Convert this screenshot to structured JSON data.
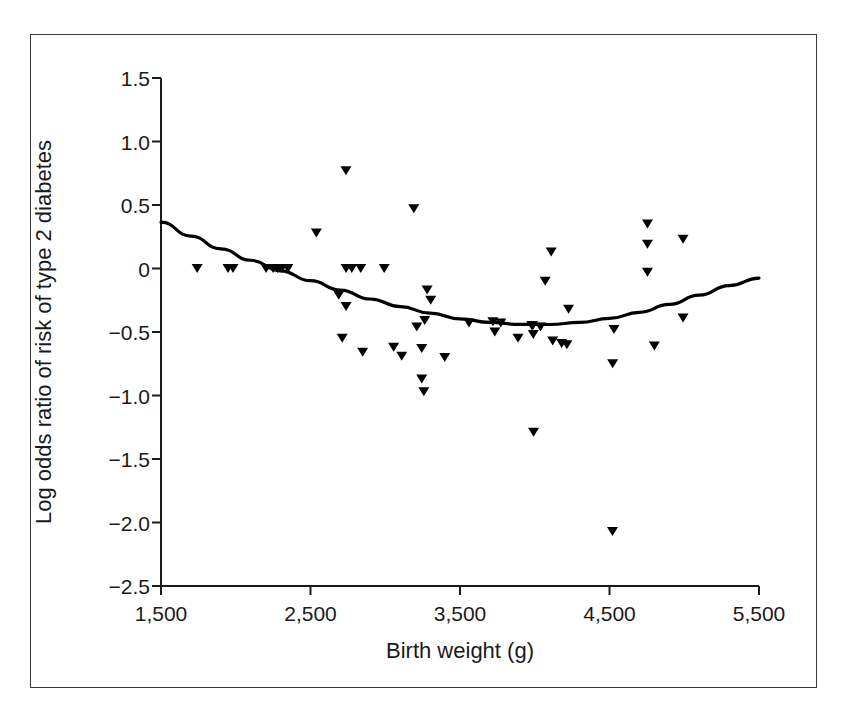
{
  "chart_data": {
    "type": "scatter",
    "title": "",
    "xlabel": "Birth weight (g)",
    "ylabel": "Log odds ratio of risk of type 2 diabetes",
    "xlim": [
      1500,
      5500
    ],
    "ylim": [
      -2.5,
      1.5
    ],
    "xticks": [
      1500,
      2500,
      3500,
      4500,
      5500
    ],
    "xtick_labels": [
      "1,500",
      "2,500",
      "3,500",
      "4,500",
      "5,500"
    ],
    "yticks": [
      1.5,
      1.0,
      0.5,
      0,
      -0.5,
      -1.0,
      -1.5,
      -2.0,
      -2.5
    ],
    "ytick_labels": [
      "1.5",
      "1.0",
      "0.5",
      "0",
      "−0.5",
      "−1.0",
      "−1.5",
      "−2.0",
      "−2.5"
    ],
    "grid": false,
    "legend": false,
    "marker": "triangle-down",
    "marker_color": "#000000",
    "series": [
      {
        "name": "Studies",
        "type": "scatter",
        "points": [
          [
            1742,
            0.0
          ],
          [
            1948,
            0.0
          ],
          [
            1982,
            0.0
          ],
          [
            2203,
            0.0
          ],
          [
            2250,
            0.0
          ],
          [
            2281,
            0.0
          ],
          [
            2308,
            0.0
          ],
          [
            2349,
            0.0
          ],
          [
            2539,
            0.28
          ],
          [
            2738,
            0.0
          ],
          [
            2776,
            0.0
          ],
          [
            2738,
            -0.3
          ],
          [
            2737,
            0.77
          ],
          [
            2712,
            -0.55
          ],
          [
            2689,
            -0.21
          ],
          [
            2849,
            -0.66
          ],
          [
            2993,
            0.0
          ],
          [
            3191,
            0.47
          ],
          [
            3056,
            -0.62
          ],
          [
            3244,
            -0.63
          ],
          [
            3211,
            -0.46
          ],
          [
            3280,
            -0.17
          ],
          [
            3304,
            -0.25
          ],
          [
            3244,
            -0.87
          ],
          [
            3110,
            -0.69
          ],
          [
            3258,
            -0.97
          ],
          [
            3398,
            -0.7
          ],
          [
            3264,
            -0.41
          ],
          [
            3560,
            -0.43
          ],
          [
            3720,
            -0.42
          ],
          [
            3773,
            -0.43
          ],
          [
            3733,
            -0.5
          ],
          [
            3888,
            -0.55
          ],
          [
            3987,
            -0.45
          ],
          [
            3990,
            -0.52
          ],
          [
            4038,
            -0.46
          ],
          [
            4110,
            0.13
          ],
          [
            4120,
            -0.57
          ],
          [
            4180,
            -0.59
          ],
          [
            4215,
            -0.6
          ],
          [
            4226,
            -0.32
          ],
          [
            4070,
            -0.1
          ],
          [
            3992,
            -1.29
          ],
          [
            4520,
            -2.07
          ],
          [
            4521,
            -0.75
          ],
          [
            4754,
            0.35
          ],
          [
            4754,
            0.19
          ],
          [
            4754,
            -0.03
          ],
          [
            4992,
            0.23
          ],
          [
            4992,
            -0.39
          ],
          [
            4800,
            -0.61
          ],
          [
            4530,
            -0.48
          ],
          [
            2836,
            0.0
          ],
          [
            3980,
            -0.45
          ]
        ]
      },
      {
        "name": "Fitted quadratic curve",
        "type": "line",
        "line_color": "#000000",
        "line_width": 3.2,
        "points": [
          [
            1500,
            0.365
          ],
          [
            1700,
            0.255
          ],
          [
            1900,
            0.155
          ],
          [
            2100,
            0.065
          ],
          [
            2300,
            -0.018
          ],
          [
            2500,
            -0.096
          ],
          [
            2700,
            -0.17
          ],
          [
            2900,
            -0.24
          ],
          [
            3100,
            -0.3
          ],
          [
            3300,
            -0.352
          ],
          [
            3500,
            -0.396
          ],
          [
            3700,
            -0.425
          ],
          [
            3900,
            -0.44
          ],
          [
            4100,
            -0.441
          ],
          [
            4300,
            -0.425
          ],
          [
            4500,
            -0.393
          ],
          [
            4700,
            -0.345
          ],
          [
            4900,
            -0.283
          ],
          [
            5100,
            -0.21
          ],
          [
            5300,
            -0.135
          ],
          [
            5500,
            -0.075
          ]
        ]
      }
    ]
  },
  "figure": {
    "frame_color": "#3a3a3a",
    "background": "#ffffff"
  }
}
